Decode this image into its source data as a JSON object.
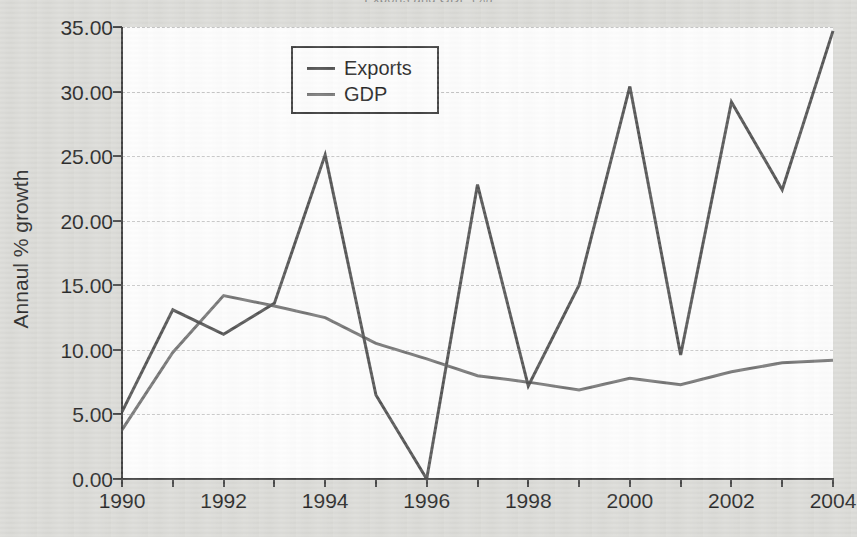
{
  "chart_data": {
    "type": "line",
    "title": "Exports and GDP (%)",
    "xlabel": "",
    "ylabel": "Annaul % growth",
    "x": [
      1990,
      1991,
      1992,
      1993,
      1994,
      1995,
      1996,
      1997,
      1998,
      1999,
      2000,
      2001,
      2002,
      2003,
      2004
    ],
    "xlim": [
      1990,
      2004
    ],
    "ylim": [
      0,
      35
    ],
    "ytick_labels": [
      "0.00",
      "5.00",
      "10.00",
      "15.00",
      "20.00",
      "25.00",
      "30.00",
      "35.00"
    ],
    "ytick_values": [
      0,
      5,
      10,
      15,
      20,
      25,
      30,
      35
    ],
    "xtick_labels": [
      "1990",
      "1992",
      "1994",
      "1996",
      "1998",
      "2000",
      "2002",
      "2004"
    ],
    "xtick_values": [
      1990,
      1992,
      1994,
      1996,
      1998,
      2000,
      2002,
      2004
    ],
    "grid": "horizontal-dashed",
    "legend_position": "top-center",
    "series": [
      {
        "name": "Exports",
        "color": "#4d4d4d",
        "values": [
          5.2,
          13.1,
          11.2,
          13.6,
          25.1,
          6.5,
          0.0,
          22.8,
          7.2,
          15.0,
          30.4,
          9.6,
          29.2,
          22.4,
          34.7
        ]
      },
      {
        "name": "GDP",
        "color": "#6f6f6f",
        "values": [
          3.8,
          9.8,
          14.2,
          13.4,
          12.5,
          10.5,
          9.3,
          8.0,
          7.5,
          6.9,
          7.8,
          7.3,
          8.3,
          9.0,
          9.2
        ]
      }
    ]
  }
}
